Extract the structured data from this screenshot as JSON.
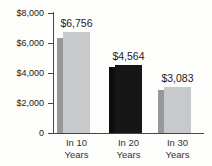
{
  "chart_data": {
    "type": "bar",
    "title": "",
    "categories": [
      "In 10 Years",
      "In 20 Years",
      "In 30 Years"
    ],
    "category_lines": [
      [
        "In 10",
        "Years"
      ],
      [
        "In 20",
        "Years"
      ],
      [
        "In 30",
        "Years"
      ]
    ],
    "series": [
      {
        "name": "back-bar-unlabeled",
        "values": [
          6330,
          4430,
          2900
        ],
        "note": "narrow darker bars behind each labeled bar; values estimated from pixel heights (unlabeled in image)"
      },
      {
        "name": "labeled-bar",
        "values": [
          6756,
          4564,
          3083
        ],
        "data_labels": [
          "$6,756",
          "$4,564",
          "$3,083"
        ]
      }
    ],
    "group_colors": [
      {
        "back": "#97989a",
        "main": "#c8c9ca"
      },
      {
        "back": "#0e0e0e",
        "main": "#161616"
      },
      {
        "back": "#97989a",
        "main": "#c8c9ca"
      }
    ],
    "ylim": [
      0,
      8000
    ],
    "yticks": [
      {
        "value": 0,
        "label": "0"
      },
      {
        "value": 2000,
        "label": "$2,000"
      },
      {
        "value": 4000,
        "label": "$4,000"
      },
      {
        "value": 6000,
        "label": "$6,000"
      },
      {
        "value": 8000,
        "label": "$8,000"
      }
    ],
    "legend": "none",
    "grid": false
  },
  "colors": {
    "background": "#fdfdfc",
    "axis": "#474747",
    "tick_text": "#222222",
    "value_text": "#1c1c1c",
    "category_text": "#333333"
  }
}
